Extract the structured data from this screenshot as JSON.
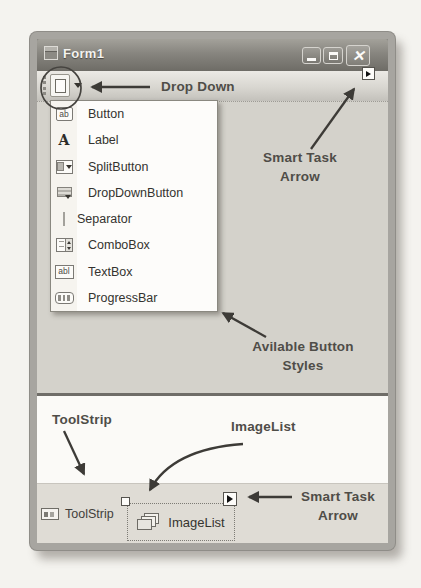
{
  "window": {
    "title": "Form1"
  },
  "icons": {
    "close_x": "✕"
  },
  "menu": {
    "items": [
      {
        "label": "Button",
        "icon": "button-ab-icon",
        "icon_text": "ab"
      },
      {
        "label": "Label",
        "icon": "label-a-icon",
        "icon_text": "A"
      },
      {
        "label": "SplitButton",
        "icon": "split-button-icon"
      },
      {
        "label": "DropDownButton",
        "icon": "drop-down-button-icon"
      },
      {
        "label": "Separator",
        "icon": "separator-icon"
      },
      {
        "label": "ComboBox",
        "icon": "combo-box-icon"
      },
      {
        "label": "TextBox",
        "icon": "text-box-icon",
        "icon_text": "abl"
      },
      {
        "label": "ProgressBar",
        "icon": "progress-bar-icon"
      }
    ]
  },
  "tray": {
    "toolstrip_label": "ToolStrip",
    "imagelist_label": "ImageList"
  },
  "annotations": {
    "drop_down": "Drop Down",
    "smart_task_top": {
      "line1": "Smart Task",
      "line2": "Arrow"
    },
    "available_styles": {
      "line1": "Avilable Button",
      "line2": "Styles"
    },
    "tool_strip": "ToolStrip",
    "image_list": "ImageList",
    "smart_task_bottom": {
      "line1": "Smart Task",
      "line2": "Arrow"
    }
  },
  "colors": {
    "titlebar": "#78766f",
    "client_area": "#d4d2cb",
    "menu_bg": "#fdfcfa",
    "tray_band": "#dfdcd5",
    "annotation_ink": "#4f4d48",
    "arrow_ink": "#3d3b37"
  }
}
